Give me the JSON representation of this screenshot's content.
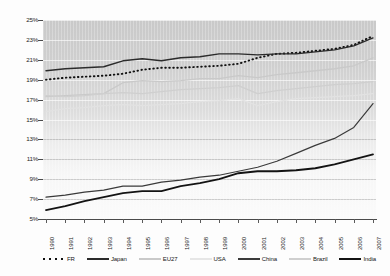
{
  "chart_data": {
    "type": "line",
    "title": "figure 1: Electricity Share on final Energy Consumption",
    "xlabel": "",
    "ylabel": "",
    "ylim": [
      5,
      25
    ],
    "yticks": [
      "5%",
      "7%",
      "9%",
      "11%",
      "13%",
      "15%",
      "17%",
      "19%",
      "21%",
      "23%",
      "25%"
    ],
    "ytick_values": [
      5,
      7,
      9,
      11,
      13,
      15,
      17,
      19,
      21,
      23,
      25
    ],
    "grid": true,
    "legend_position": "bottom",
    "x": [
      "1990",
      "1991",
      "1992",
      "1993",
      "1994",
      "1995",
      "1996",
      "1997",
      "1998",
      "1999",
      "2000",
      "2001",
      "2002",
      "2003",
      "2004",
      "2005",
      "2006",
      "2007"
    ],
    "categories": [
      "1990",
      "1991",
      "1992",
      "1993",
      "1994",
      "1995",
      "1996",
      "1997",
      "1998",
      "1999",
      "2000",
      "2001",
      "2002",
      "2003",
      "2004",
      "2005",
      "2006",
      "2007"
    ],
    "series": [
      {
        "name": "FR",
        "color": "#111111",
        "style": "dotted",
        "width": 1.9,
        "values": [
          19.0,
          19.2,
          19.3,
          19.4,
          19.6,
          20.0,
          20.2,
          20.2,
          20.3,
          20.4,
          20.6,
          21.2,
          21.6,
          21.7,
          21.9,
          22.1,
          22.5,
          23.4
        ]
      },
      {
        "name": "Japan",
        "color": "#2b2b2b",
        "style": "solid",
        "width": 1.4,
        "values": [
          19.9,
          20.1,
          20.2,
          20.3,
          20.9,
          21.1,
          20.9,
          21.2,
          21.3,
          21.6,
          21.6,
          21.5,
          21.6,
          21.6,
          21.8,
          22.0,
          22.4,
          23.2
        ]
      },
      {
        "name": "EU27",
        "color": "#c9c9c9",
        "style": "solid",
        "width": 1.3,
        "values": [
          17.3,
          17.4,
          17.5,
          17.6,
          18.7,
          18.9,
          18.8,
          18.9,
          19.1,
          19.1,
          19.4,
          19.2,
          19.5,
          19.7,
          19.9,
          20.1,
          20.4,
          21.2
        ]
      },
      {
        "name": "USA",
        "color": "#e2e2e2",
        "style": "solid",
        "width": 1.3,
        "values": [
          15.8,
          16.1,
          16.2,
          16.4,
          16.5,
          16.4,
          16.5,
          16.6,
          16.8,
          16.9,
          17.1,
          16.4,
          16.8,
          17.1,
          17.2,
          17.3,
          17.4,
          17.6
        ]
      },
      {
        "name": "China",
        "color": "#3a3a3a",
        "style": "solid",
        "width": 1.2,
        "values": [
          7.2,
          7.4,
          7.7,
          7.9,
          8.3,
          8.3,
          8.7,
          8.9,
          9.2,
          9.4,
          9.8,
          10.2,
          10.8,
          11.6,
          12.4,
          13.1,
          14.2,
          16.6
        ]
      },
      {
        "name": "Brazil",
        "color": "#cfcfcf",
        "style": "solid",
        "width": 1.3,
        "values": [
          17.4,
          17.3,
          17.4,
          17.6,
          17.7,
          17.6,
          17.8,
          18.0,
          18.1,
          18.2,
          18.4,
          17.6,
          17.9,
          18.1,
          18.3,
          18.5,
          18.6,
          18.8
        ]
      },
      {
        "name": "India",
        "color": "#131313",
        "style": "solid",
        "width": 1.8,
        "values": [
          5.9,
          6.3,
          6.8,
          7.2,
          7.6,
          7.8,
          7.8,
          8.3,
          8.6,
          9.0,
          9.6,
          9.8,
          9.8,
          9.9,
          10.1,
          10.5,
          11.0,
          11.5
        ]
      }
    ]
  },
  "legend": {
    "items": [
      {
        "label": "FR",
        "style": "dotted",
        "color": "#111111"
      },
      {
        "label": "Japan",
        "style": "solid",
        "color": "#2b2b2b"
      },
      {
        "label": "EU27",
        "style": "solid",
        "color": "#c9c9c9"
      },
      {
        "label": "USA",
        "style": "solid",
        "color": "#e6e6e6"
      },
      {
        "label": "China",
        "style": "solid",
        "color": "#3a3a3a"
      },
      {
        "label": "Brazil",
        "style": "solid",
        "color": "#cfcfcf"
      },
      {
        "label": "India",
        "style": "solid",
        "color": "#131313"
      }
    ]
  }
}
